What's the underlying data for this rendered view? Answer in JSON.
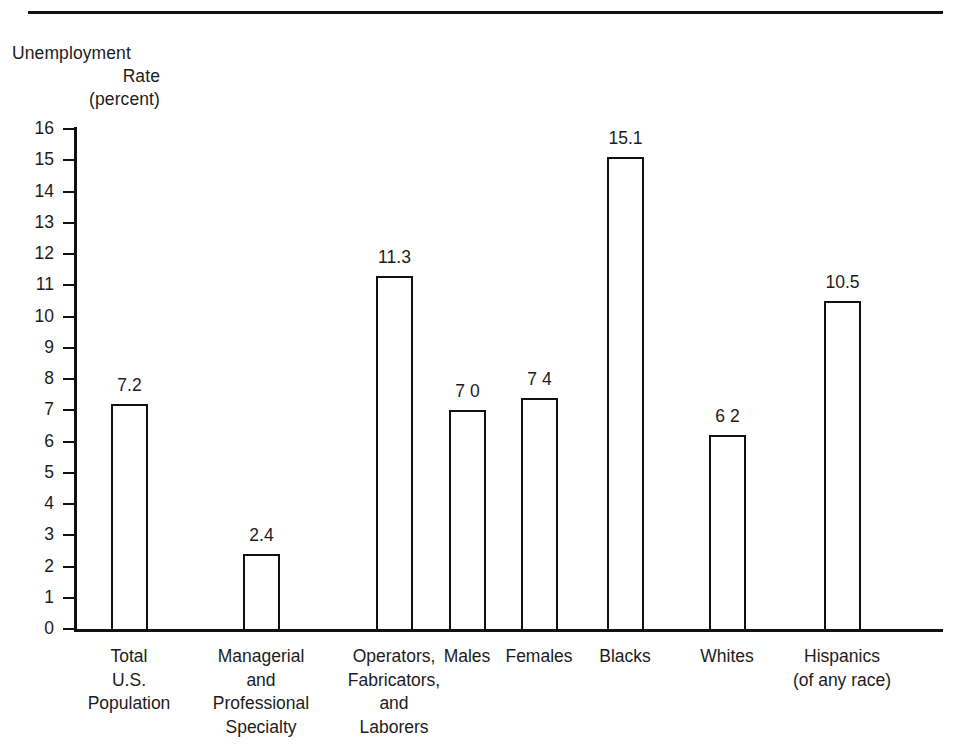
{
  "page": {
    "width": 965,
    "height": 746,
    "background": "#ffffff",
    "ink_color": "#111111",
    "title_remnant": ""
  },
  "axis_caption": {
    "line1": "Unemployment",
    "line2": "Rate",
    "line3": "(percent)"
  },
  "chart_data": {
    "type": "bar",
    "title": "",
    "xlabel": "",
    "ylabel": "Unemployment Rate (percent)",
    "ylim": [
      0,
      16
    ],
    "ytick_step": 1,
    "grid": false,
    "legend": "none",
    "bar_style": "open outline, white fill, black stroke",
    "categories": [
      "Total U.S. Population",
      "Managerial and Professional Specialty",
      "Operators, Fabricators, and Laborers",
      "Males",
      "Females",
      "Blacks",
      "Whites",
      "Hispanics (of any race)"
    ],
    "category_label_lines": [
      [
        "Total",
        "U.S.",
        "Population"
      ],
      [
        "Managerial",
        "and",
        "Professional",
        "Specialty"
      ],
      [
        "Operators,",
        "Fabricators,",
        "and",
        "Laborers"
      ],
      [
        "Males"
      ],
      [
        "Females"
      ],
      [
        "Blacks"
      ],
      [
        "Whites"
      ],
      [
        "Hispanics",
        "(of any race)"
      ]
    ],
    "values": [
      7.2,
      2.4,
      11.3,
      7.0,
      7.4,
      15.1,
      6.2,
      10.5
    ],
    "value_labels": [
      "7.2",
      "2.4",
      "11.3",
      "7 0",
      "7 4",
      "15.1",
      "6 2",
      "10.5"
    ],
    "ytick_labels": [
      "16",
      "15",
      "14",
      "13",
      "12",
      "11",
      "10",
      "9",
      "8",
      "7",
      "6",
      "5",
      "4",
      "3",
      "2",
      "1",
      "0"
    ],
    "ytick_values": [
      16,
      15,
      14,
      13,
      12,
      11,
      10,
      9,
      8,
      7,
      6,
      5,
      4,
      3,
      2,
      1,
      0
    ]
  },
  "geometry": {
    "bar_left_px": [
      111,
      243,
      376,
      449,
      521,
      607,
      709,
      824
    ],
    "bar_width_px": [
      37,
      37,
      37,
      37,
      37,
      37,
      37,
      37
    ],
    "label_center_px": [
      129,
      261,
      394,
      467,
      539,
      625,
      727,
      842
    ],
    "label_width_px": [
      150,
      160,
      150,
      110,
      110,
      110,
      110,
      170
    ]
  }
}
